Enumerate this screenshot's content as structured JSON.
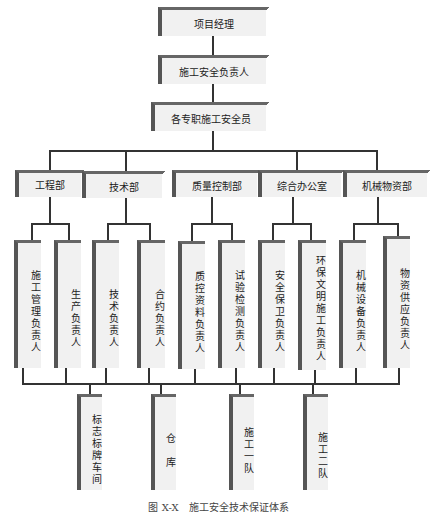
{
  "diagram": {
    "top": [
      {
        "label": "项目经理"
      },
      {
        "label": "施工安全负责人"
      },
      {
        "label": "各专职施工安全员"
      }
    ],
    "departments": [
      {
        "label": "工程部",
        "roles": [
          "施工管理负责人",
          "生产负责人"
        ]
      },
      {
        "label": "技术部",
        "roles": [
          "技术负责人",
          "合约负责人"
        ]
      },
      {
        "label": "质量控制部",
        "roles": [
          "质控资料负责人",
          "试验检测负责人"
        ]
      },
      {
        "label": "综合办公室",
        "roles": [
          "安全保卫负责人",
          "环保文明施工负责人"
        ]
      },
      {
        "label": "机械物资部",
        "roles": [
          "机械设备负责人",
          "物资供应负责人"
        ]
      }
    ],
    "units": [
      {
        "label": "标志标牌车间"
      },
      {
        "label": "仓　库"
      },
      {
        "label": "施工一队"
      },
      {
        "label": "施工二队"
      }
    ],
    "caption": "图 X-X　施工安全技术保证体系"
  }
}
